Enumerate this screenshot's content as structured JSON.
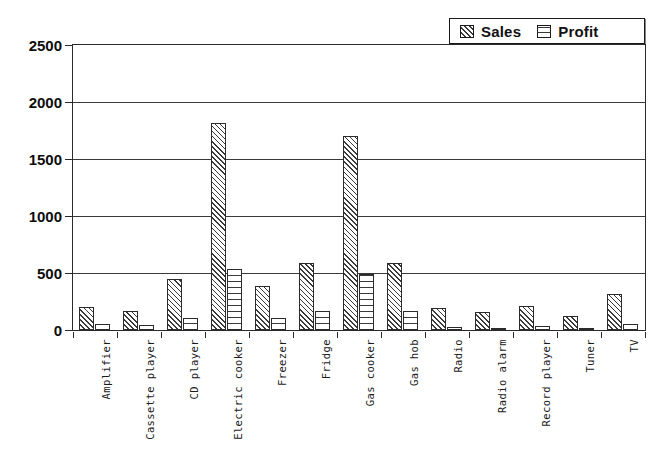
{
  "chart_data": {
    "type": "bar",
    "title": "",
    "xlabel": "",
    "ylabel": "",
    "ylim": [
      0,
      2500
    ],
    "yticks": [
      0,
      500,
      1000,
      1500,
      2000,
      2500
    ],
    "grid": true,
    "legend_position": "top-right",
    "categories": [
      "Amplifier",
      "Cassette player",
      "CD player",
      "Electric cooker",
      "Freezer",
      "Fridge",
      "Gas cooker",
      "Gas hob",
      "Radio",
      "Radio alarm",
      "Record player",
      "Tuner",
      "TV"
    ],
    "series": [
      {
        "name": "Sales",
        "pattern": "diagonal-hatch",
        "values": [
          205,
          165,
          450,
          1820,
          385,
          585,
          1700,
          590,
          190,
          160,
          215,
          125,
          315
        ]
      },
      {
        "name": "Profit",
        "pattern": "horizontal-hatch",
        "values": [
          50,
          40,
          105,
          535,
          105,
          165,
          495,
          165,
          25,
          20,
          38,
          20,
          55
        ]
      }
    ]
  },
  "legend": {
    "entries": [
      {
        "label": "Sales",
        "icon": "diagonal-hatch-swatch"
      },
      {
        "label": "Profit",
        "icon": "horizontal-hatch-swatch"
      }
    ]
  },
  "axes": {
    "y": {
      "ticks": [
        "0",
        "500",
        "1000",
        "1500",
        "2000",
        "2500"
      ]
    }
  },
  "colors": {
    "background": "#ffffff",
    "axis": "#2a2a2a",
    "grid": "#3a3a3a",
    "text": "#111111",
    "hatch": "#3a3a3a"
  }
}
